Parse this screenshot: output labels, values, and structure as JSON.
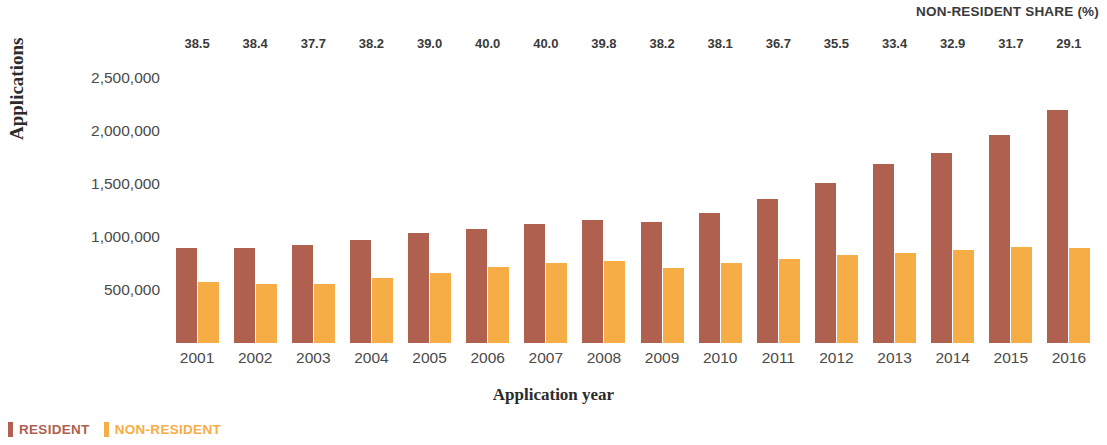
{
  "header": {
    "share_label": "NON-RESIDENT SHARE (%)"
  },
  "axes": {
    "ylabel": "Applications",
    "xlabel": "Application year",
    "yticks": [
      "2,500,000",
      "2,000,000",
      "1,500,000",
      "1,000,000",
      "500,000"
    ]
  },
  "legend": {
    "items": [
      {
        "label": "RESIDENT",
        "color": "#b0604f"
      },
      {
        "label": "NON-RESIDENT",
        "color": "#f7ad45"
      }
    ]
  },
  "chart_data": {
    "type": "bar",
    "title": "",
    "subtitle": "",
    "xlabel": "Application year",
    "ylabel": "Applications",
    "ylim": [
      0,
      2650000
    ],
    "ytick_values": [
      2500000,
      2000000,
      1500000,
      1000000,
      500000
    ],
    "ytick_labels": [
      "2,500,000",
      "2,000,000",
      "1,500,000",
      "1,000,000",
      "500,000"
    ],
    "grid": false,
    "legend_position": "bottom-left",
    "categories": [
      "2001",
      "2002",
      "2003",
      "2004",
      "2005",
      "2006",
      "2007",
      "2008",
      "2009",
      "2010",
      "2011",
      "2012",
      "2013",
      "2014",
      "2015",
      "2016"
    ],
    "series": [
      {
        "name": "RESIDENT",
        "color": "#b0604f",
        "values": [
          900000,
          895000,
          925000,
          975000,
          1040000,
          1075000,
          1120000,
          1160000,
          1145000,
          1225000,
          1360000,
          1510000,
          1690000,
          1790000,
          1965000,
          2200000
        ]
      },
      {
        "name": "NON-RESIDENT",
        "color": "#f7ad45",
        "values": [
          575000,
          560000,
          560000,
          610000,
          665000,
          715000,
          750000,
          770000,
          710000,
          755000,
          790000,
          830000,
          850000,
          875000,
          905000,
          895000
        ]
      }
    ],
    "annotations": {
      "label": "NON-RESIDENT SHARE (%)",
      "position": "top",
      "values": [
        "38.5",
        "38.4",
        "37.7",
        "38.2",
        "39.0",
        "40.0",
        "40.0",
        "39.8",
        "38.2",
        "38.1",
        "36.7",
        "35.5",
        "33.4",
        "32.9",
        "31.7",
        "29.1"
      ]
    }
  }
}
